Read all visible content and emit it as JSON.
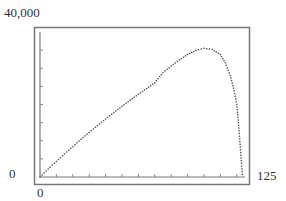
{
  "chart_data": {
    "type": "scatter",
    "title": "",
    "xlabel": "",
    "ylabel": "",
    "xlim": [
      0,
      125
    ],
    "ylim": [
      0,
      40000
    ],
    "x_tick_step": 10,
    "y_tick_step": 5000,
    "tick_labels": {
      "x_min": "0",
      "x_max": "125",
      "y_min": "0",
      "y_max": "40,000"
    },
    "grid": false,
    "legend": null,
    "series": [
      {
        "name": "curve",
        "style": "dotted",
        "points": [
          [
            0,
            0
          ],
          [
            5,
            2200
          ],
          [
            10,
            4300
          ],
          [
            15,
            6400
          ],
          [
            20,
            8400
          ],
          [
            25,
            10400
          ],
          [
            30,
            12300
          ],
          [
            35,
            14200
          ],
          [
            40,
            16000
          ],
          [
            45,
            17800
          ],
          [
            50,
            19500
          ],
          [
            55,
            21200
          ],
          [
            60,
            22800
          ],
          [
            65,
            24400
          ],
          [
            70,
            26000
          ],
          [
            75,
            28800
          ],
          [
            80,
            30600
          ],
          [
            85,
            32300
          ],
          [
            90,
            33800
          ],
          [
            95,
            34900
          ],
          [
            100,
            35500
          ],
          [
            105,
            35200
          ],
          [
            110,
            33800
          ],
          [
            113,
            31500
          ],
          [
            116,
            28000
          ],
          [
            118,
            24500
          ],
          [
            120,
            20000
          ],
          [
            121,
            15000
          ],
          [
            122,
            9000
          ],
          [
            123,
            3000
          ],
          [
            123.5,
            0
          ]
        ]
      }
    ]
  }
}
